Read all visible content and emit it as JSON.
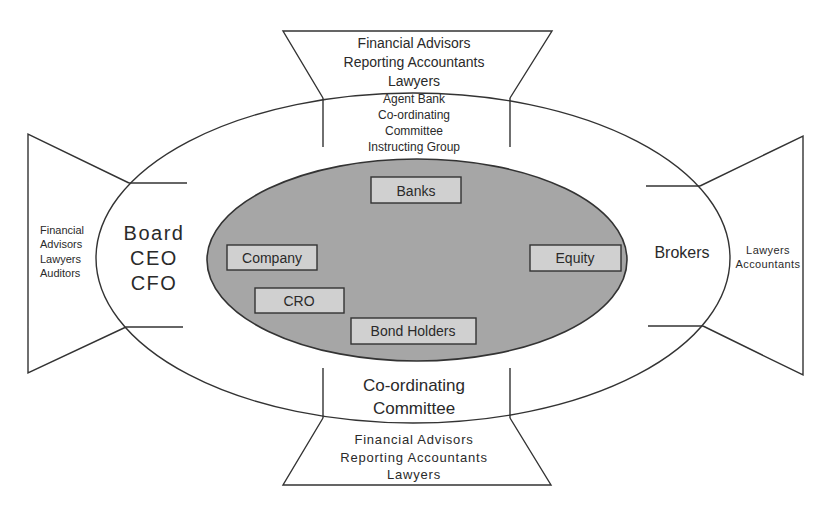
{
  "diagram": {
    "colors": {
      "line": "#333333",
      "inner_ellipse_fill": "#a6a6a6",
      "box_fill": "#d0d0d0",
      "background": "#ffffff",
      "text": "#2a2a2a"
    },
    "top_trapezoid": {
      "outer_lines": [
        "Financial Advisors",
        "Reporting Accountants",
        "Lawyers"
      ],
      "inner_lines": [
        "Agent Bank",
        "Co-ordinating",
        "Committee",
        "Instructing Group"
      ]
    },
    "left_trapezoid": {
      "outer_lines": [
        "Financial",
        "Advisors",
        "Lawyers",
        "Auditors"
      ],
      "inner_lines": [
        "Board",
        "CEO",
        "CFO"
      ]
    },
    "right_trapezoid": {
      "outer_lines": [
        "Lawyers",
        "Accountants"
      ],
      "inner_lines": [
        "Brokers"
      ]
    },
    "bottom_trapezoid": {
      "inner_lines": [
        "Co-ordinating",
        "Committee"
      ],
      "outer_lines": [
        "Financial Advisors",
        "Reporting Accountants",
        "Lawyers"
      ]
    },
    "core_boxes": [
      {
        "id": "banks",
        "label": "Banks"
      },
      {
        "id": "company",
        "label": "Company"
      },
      {
        "id": "equity",
        "label": "Equity"
      },
      {
        "id": "cro",
        "label": "CRO"
      },
      {
        "id": "bond-holders",
        "label": "Bond Holders"
      }
    ]
  }
}
